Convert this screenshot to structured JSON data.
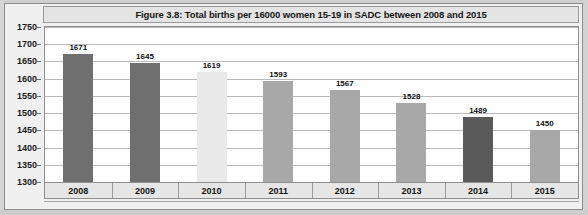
{
  "chart_data": {
    "type": "bar",
    "title": "Figure 3.8: Total births per 16000 women 15-19 in SADC between 2008 and 2015",
    "xlabel": "",
    "ylabel": "",
    "categories": [
      "2008",
      "2009",
      "2010",
      "2011",
      "2012",
      "2013",
      "2014",
      "2015"
    ],
    "values": [
      1671,
      1645,
      1619,
      1593,
      1567,
      1528,
      1489,
      1450
    ],
    "value_labels": [
      "1671",
      "1645",
      "1619",
      "1593",
      "1567",
      "1528",
      "1489",
      "1450"
    ],
    "ylim": [
      1300,
      1750
    ],
    "ytick_labels": [
      "1750",
      "1700",
      "1650",
      "1600",
      "1550",
      "1500",
      "1450",
      "1400",
      "1350",
      "1300"
    ],
    "yticks": [
      1750,
      1700,
      1650,
      1600,
      1550,
      1500,
      1450,
      1400,
      1350,
      1300
    ],
    "grid": true,
    "legend": "none",
    "bar_colors": [
      "#6f6f6f",
      "#6f6f6f",
      "#e9e9e9",
      "#a8a8a8",
      "#a8a8a8",
      "#a8a8a8",
      "#5a5a5a",
      "#a8a8a8"
    ],
    "series": [
      {
        "name": "Total births per 16000 women 15-19",
        "values": [
          1671,
          1645,
          1619,
          1593,
          1567,
          1528,
          1489,
          1450
        ]
      }
    ]
  },
  "colors": {
    "plot_background": "#ffffff",
    "page_background": "#f0f0f0",
    "gridline": "#b9b9b9",
    "axis_band": "#e6e6e6",
    "title_band": "#e4e4e4",
    "text": "#141414"
  }
}
